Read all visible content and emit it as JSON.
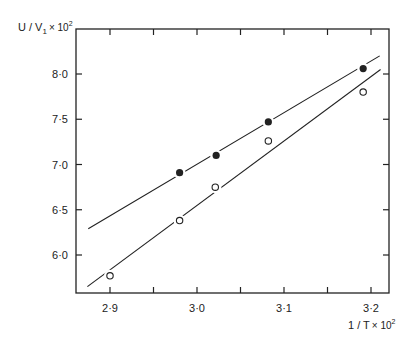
{
  "chart_data": {
    "type": "scatter",
    "title": "",
    "xlabel": "1 / T × 10²",
    "ylabel": "U / V₁ × 10²",
    "xlim": [
      2.862,
      3.22
    ],
    "ylim": [
      5.58,
      8.5
    ],
    "x_ticks": [
      2.9,
      2.95,
      3.0,
      3.05,
      3.1,
      3.15,
      3.2
    ],
    "x_tick_labels": [
      "2·9",
      "",
      "3·0",
      "",
      "3·1",
      "",
      "3·2"
    ],
    "y_ticks": [
      6.0,
      6.5,
      7.0,
      7.5,
      8.0
    ],
    "y_tick_labels": [
      "6·0",
      "6·5",
      "7·0",
      "7·5",
      "8·0"
    ],
    "grid": false,
    "legend": null,
    "series": [
      {
        "name": "filled",
        "marker": "filled-circle",
        "x": [
          2.98,
          3.022,
          3.082,
          3.191
        ],
        "y": [
          6.91,
          7.1,
          7.47,
          8.06
        ],
        "fit_line": {
          "x": [
            2.875,
            3.21
          ],
          "y": [
            6.29,
            8.2
          ]
        }
      },
      {
        "name": "open",
        "marker": "open-circle",
        "x": [
          2.9,
          2.98,
          3.021,
          3.082,
          3.191
        ],
        "y": [
          5.77,
          6.38,
          6.75,
          7.26,
          7.8
        ],
        "fit_line": {
          "x": [
            2.874,
            3.211
          ],
          "y": [
            5.65,
            8.05
          ]
        }
      }
    ]
  },
  "labels": {
    "y_axis_main": "U / V",
    "y_axis_sub": "1",
    "y_axis_mult": "× 10",
    "y_axis_exp": "2",
    "x_axis_main": "1 / T",
    "x_axis_mult": "× 10",
    "x_axis_exp": "2"
  }
}
